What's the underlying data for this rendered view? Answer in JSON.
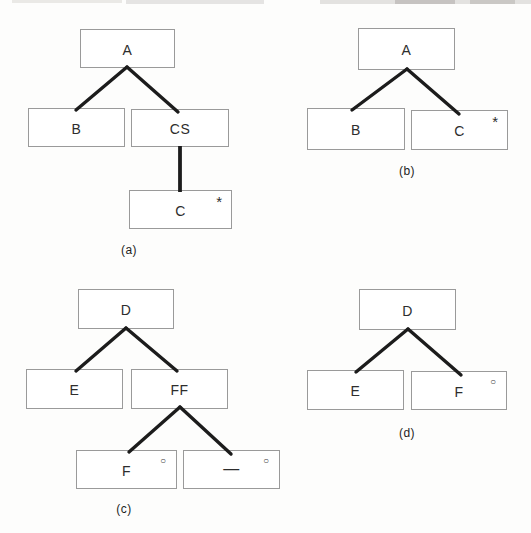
{
  "figure": {
    "colors": {
      "background": "#fdfdfc",
      "box_border": "#9a9a9a",
      "edge_line": "#1c1c1c",
      "text": "#2d2d2d"
    },
    "diagrams": {
      "a": {
        "caption": "(a)",
        "nodes": {
          "root": {
            "label": "A"
          },
          "left": {
            "label": "B"
          },
          "right": {
            "label": "CS"
          },
          "child": {
            "label": "C",
            "marker": "*"
          }
        }
      },
      "b": {
        "caption": "(b)",
        "nodes": {
          "root": {
            "label": "A"
          },
          "left": {
            "label": "B"
          },
          "right": {
            "label": "C",
            "marker": "*"
          }
        }
      },
      "c": {
        "caption": "(c)",
        "nodes": {
          "root": {
            "label": "D"
          },
          "left": {
            "label": "E"
          },
          "right": {
            "label": "FF"
          },
          "grandchild_left": {
            "label": "F",
            "marker": "○"
          },
          "grandchild_right": {
            "label": "—",
            "marker": "○"
          }
        }
      },
      "d": {
        "caption": "(d)",
        "nodes": {
          "root": {
            "label": "D"
          },
          "left": {
            "label": "E"
          },
          "right": {
            "label": "F",
            "marker": "○"
          }
        }
      }
    }
  }
}
